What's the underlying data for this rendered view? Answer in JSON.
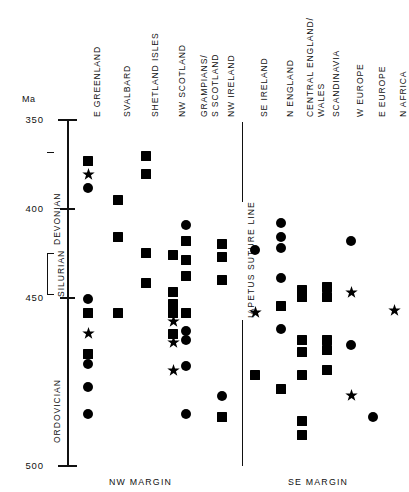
{
  "chart_data": {
    "type": "scatter",
    "title": "",
    "ylabel": "Ma",
    "ylim": [
      350,
      500
    ],
    "y_axis_inverted": true,
    "yticks": [
      350,
      400,
      450,
      500
    ],
    "ytick_labels": [
      "350",
      "400",
      "450",
      "500"
    ],
    "grid": false,
    "legend_position": "none",
    "axis_unit_label": "Ma",
    "periods": [
      {
        "name": "DEVONIAN",
        "top": 350,
        "bottom": 408
      },
      {
        "name": "SILURIAN",
        "top": 408,
        "bottom": 438
      },
      {
        "name": "ORDOVICIAN",
        "top": 438,
        "bottom": 500
      }
    ],
    "divider": {
      "label": "IAPETUS SUTURE LINE",
      "at_column_index": 6
    },
    "group_labels": [
      {
        "label": "NW MARGIN",
        "columns": [
          0,
          1,
          2,
          3,
          4,
          5
        ]
      },
      {
        "label": "SE MARGIN",
        "columns": [
          6,
          7,
          8,
          9,
          10,
          11,
          12
        ]
      }
    ],
    "marker_types": [
      "square",
      "circle",
      "star"
    ],
    "categories": [
      "E GREENLAND",
      "SVALBARD",
      "SHETLAND ISLES",
      "NW SCOTLAND",
      "GRAMPIANS/ S SCOTLAND",
      "NW IRELAND",
      "SE IRELAND",
      "N ENGLAND",
      "CENTRAL ENGLAND/ WALES",
      "SCANDINAVIA",
      "W EUROPE",
      "E EUROPE",
      "N AFRICA"
    ],
    "series": [
      {
        "name": "E GREENLAND",
        "points": [
          {
            "value": 368,
            "marker": "square"
          },
          {
            "value": 374,
            "marker": "star"
          },
          {
            "value": 380,
            "marker": "circle"
          },
          {
            "value": 428,
            "marker": "circle"
          },
          {
            "value": 434,
            "marker": "square"
          },
          {
            "value": 443,
            "marker": "star"
          },
          {
            "value": 452,
            "marker": "square"
          },
          {
            "value": 456,
            "marker": "circle"
          },
          {
            "value": 466,
            "marker": "circle"
          },
          {
            "value": 478,
            "marker": "circle"
          }
        ]
      },
      {
        "name": "SVALBARD",
        "points": [
          {
            "value": 385,
            "marker": "square"
          },
          {
            "value": 401,
            "marker": "square"
          },
          {
            "value": 434,
            "marker": "square"
          }
        ]
      },
      {
        "name": "SHETLAND ISLES",
        "points": [
          {
            "value": 366,
            "marker": "square"
          },
          {
            "value": 374,
            "marker": "square"
          },
          {
            "value": 408,
            "marker": "square"
          },
          {
            "value": 421,
            "marker": "square"
          }
        ]
      },
      {
        "name": "NW SCOTLAND",
        "points": [
          {
            "value": 409,
            "marker": "square"
          },
          {
            "value": 425,
            "marker": "square"
          },
          {
            "value": 430,
            "marker": "square"
          },
          {
            "value": 434,
            "marker": "square"
          },
          {
            "value": 438,
            "marker": "star"
          },
          {
            "value": 443,
            "marker": "square"
          },
          {
            "value": 447,
            "marker": "star"
          },
          {
            "value": 459,
            "marker": "star"
          }
        ]
      },
      {
        "name": "GRAMPIANS/ S SCOTLAND",
        "points": [
          {
            "value": 396,
            "marker": "circle"
          },
          {
            "value": 403,
            "marker": "square"
          },
          {
            "value": 411,
            "marker": "square"
          },
          {
            "value": 418,
            "marker": "square"
          },
          {
            "value": 434,
            "marker": "square"
          },
          {
            "value": 442,
            "marker": "circle"
          },
          {
            "value": 446,
            "marker": "circle"
          },
          {
            "value": 457,
            "marker": "circle"
          },
          {
            "value": 478,
            "marker": "circle"
          }
        ]
      },
      {
        "name": "NW IRELAND",
        "points": [
          {
            "value": 404,
            "marker": "square"
          },
          {
            "value": 410,
            "marker": "square"
          },
          {
            "value": 420,
            "marker": "square"
          },
          {
            "value": 470,
            "marker": "circle"
          },
          {
            "value": 479,
            "marker": "square"
          }
        ]
      },
      {
        "name": "SE IRELAND",
        "points": [
          {
            "value": 407,
            "marker": "circle"
          },
          {
            "value": 434,
            "marker": "star"
          },
          {
            "value": 461,
            "marker": "square"
          }
        ]
      },
      {
        "name": "N ENGLAND",
        "points": [
          {
            "value": 395,
            "marker": "circle"
          },
          {
            "value": 401,
            "marker": "circle"
          },
          {
            "value": 406,
            "marker": "circle"
          },
          {
            "value": 419,
            "marker": "circle"
          },
          {
            "value": 431,
            "marker": "square"
          },
          {
            "value": 441,
            "marker": "circle"
          },
          {
            "value": 467,
            "marker": "square"
          }
        ]
      },
      {
        "name": "CENTRAL ENGLAND/ WALES",
        "points": [
          {
            "value": 424,
            "marker": "square"
          },
          {
            "value": 427,
            "marker": "square"
          },
          {
            "value": 446,
            "marker": "square"
          },
          {
            "value": 451,
            "marker": "square"
          },
          {
            "value": 461,
            "marker": "square"
          },
          {
            "value": 481,
            "marker": "square"
          },
          {
            "value": 487,
            "marker": "square"
          }
        ]
      },
      {
        "name": "SCANDINAVIA",
        "points": [
          {
            "value": 423,
            "marker": "square"
          },
          {
            "value": 427,
            "marker": "square"
          },
          {
            "value": 446,
            "marker": "square"
          },
          {
            "value": 450,
            "marker": "square"
          },
          {
            "value": 459,
            "marker": "square"
          }
        ]
      },
      {
        "name": "W EUROPE",
        "points": [
          {
            "value": 403,
            "marker": "circle"
          },
          {
            "value": 425,
            "marker": "star"
          },
          {
            "value": 448,
            "marker": "circle"
          },
          {
            "value": 470,
            "marker": "star"
          }
        ]
      },
      {
        "name": "E EUROPE",
        "points": [
          {
            "value": 479,
            "marker": "circle"
          }
        ]
      },
      {
        "name": "N AFRICA",
        "points": [
          {
            "value": 433,
            "marker": "star"
          }
        ]
      }
    ]
  },
  "axis": {
    "unit": "Ma",
    "labels": [
      "350",
      "400",
      "450",
      "500"
    ]
  },
  "periods": {
    "devonian": "DEVONIAN",
    "silurian": "SILURIAN",
    "ordovician": "ORDOVICIAN"
  },
  "columns": {
    "c0": "E GREENLAND",
    "c1": "SVALBARD",
    "c2": "SHETLAND ISLES",
    "c3": "NW SCOTLAND",
    "c4a": "GRAMPIANS/",
    "c4b": "S SCOTLAND",
    "c5": "NW IRELAND",
    "c6": "SE IRELAND",
    "c7": "N ENGLAND",
    "c8a": "CENTRAL ENGLAND/",
    "c8b": "WALES",
    "c9": "SCANDINAVIA",
    "c10": "W EUROPE",
    "c11": "E EUROPE",
    "c12": "N AFRICA"
  },
  "divider": {
    "label": "IAPETUS SUTURE LINE"
  },
  "footers": {
    "nw": "NW MARGIN",
    "se": "SE MARGIN"
  }
}
